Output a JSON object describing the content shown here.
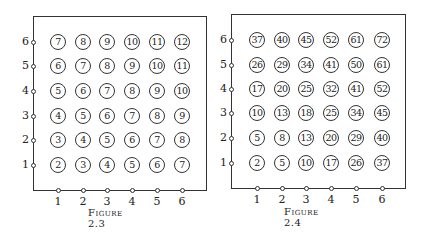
{
  "figures": [
    {
      "caption": "Figure 2.3",
      "x_ticks": [
        "1",
        "2",
        "3",
        "4",
        "5",
        "6"
      ],
      "y_ticks": [
        "6",
        "5",
        "4",
        "3",
        "2",
        "1"
      ],
      "grid": [
        [
          "7",
          "8",
          "9",
          "10",
          "11",
          "12"
        ],
        [
          "6",
          "7",
          "8",
          "9",
          "10",
          "11"
        ],
        [
          "5",
          "6",
          "7",
          "8",
          "9",
          "10"
        ],
        [
          "4",
          "5",
          "6",
          "7",
          "8",
          "9"
        ],
        [
          "3",
          "4",
          "5",
          "6",
          "7",
          "8"
        ],
        [
          "2",
          "3",
          "4",
          "5",
          "6",
          "7"
        ]
      ]
    },
    {
      "caption": "Figure 2.4",
      "x_ticks": [
        "1",
        "2",
        "3",
        "4",
        "5",
        "6"
      ],
      "y_ticks": [
        "6",
        "5",
        "4",
        "3",
        "2",
        "1"
      ],
      "grid": [
        [
          "37",
          "40",
          "45",
          "52",
          "61",
          "72"
        ],
        [
          "26",
          "29",
          "34",
          "41",
          "50",
          "61"
        ],
        [
          "17",
          "20",
          "25",
          "32",
          "41",
          "52"
        ],
        [
          "10",
          "13",
          "18",
          "25",
          "34",
          "45"
        ],
        [
          "5",
          "8",
          "13",
          "20",
          "29",
          "40"
        ],
        [
          "2",
          "5",
          "10",
          "17",
          "26",
          "37"
        ]
      ]
    }
  ]
}
